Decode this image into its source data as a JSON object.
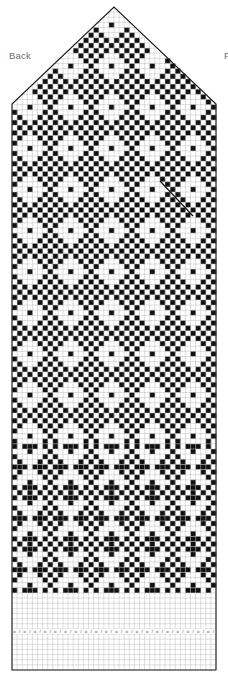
{
  "chart": {
    "labels": {
      "back": "Back",
      "front": "F"
    },
    "colors": {
      "dark": "#101010",
      "light": "#ffffff",
      "gridline": "#bdbdbd",
      "outline": "#1a1a1a",
      "label_text": "#6e6e6e"
    },
    "geometry": {
      "cols": 40,
      "rows": 129,
      "cell_px": 5.1,
      "grid_left": 12,
      "grid_right": 216,
      "grid_top": 7,
      "grid_bottom": 670,
      "apex_x": 114,
      "apex_y": 7,
      "shoulder_y": 104
    },
    "sections": [
      {
        "name": "crown-decrease-triangle",
        "start_row": 0,
        "end_row": 18,
        "pattern": "star-motif"
      },
      {
        "name": "main-body",
        "start_row": 19,
        "end_row": 84,
        "pattern": "star-motif"
      },
      {
        "name": "lower-band",
        "start_row": 85,
        "end_row": 113,
        "pattern": "diamond-zigzag"
      },
      {
        "name": "plain-cuff",
        "start_row": 114,
        "end_row": 128,
        "pattern": "blank"
      }
    ],
    "eyelet_row": {
      "row_index": 121,
      "symbol_pair": [
        "o",
        "/"
      ],
      "repeat_count": 20,
      "note": "alternating yarn-over and decrease symbols"
    },
    "annotation": {
      "type": "diagonal-line",
      "x1": 160,
      "y1": 181,
      "x2": 193,
      "y2": 216
    }
  }
}
